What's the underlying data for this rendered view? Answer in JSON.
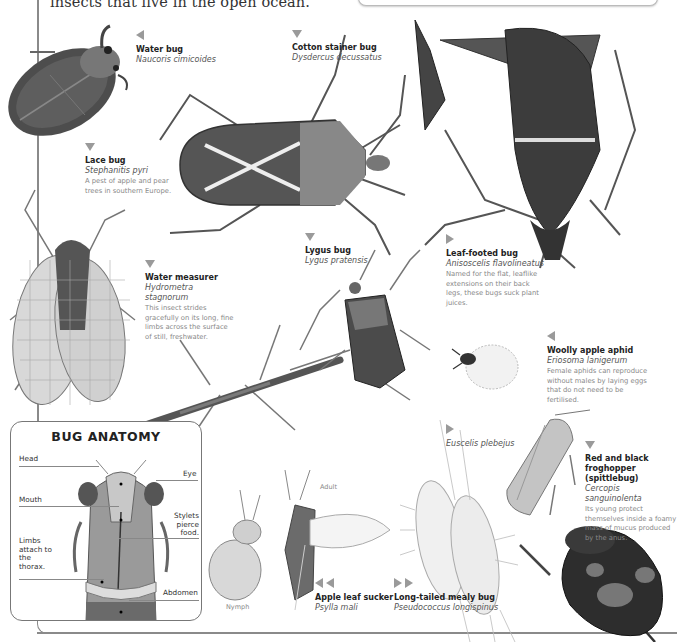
{
  "page": {
    "intro_text": "insects that live in the open ocean."
  },
  "species": [
    {
      "id": "water-bug",
      "common": "Water bug",
      "latin": "Naucoris cimicoides",
      "description": "",
      "pointer": "left"
    },
    {
      "id": "cotton-stainer",
      "common": "Cotton stainer bug",
      "latin": "Dysdercus decussatus",
      "description": "",
      "pointer": "down"
    },
    {
      "id": "lace-bug",
      "common": "Lace bug",
      "latin": "Stephanitis pyri",
      "description": "A pest of apple and pear trees in southern Europe.",
      "pointer": "down"
    },
    {
      "id": "water-measurer",
      "common": "Water measurer",
      "latin": "Hydrometra stagnorum",
      "description": "This insect strides gracefully on its long, fine limbs across the surface of still, freshwater.",
      "pointer": "down"
    },
    {
      "id": "lygus-bug",
      "common": "Lygus bug",
      "latin": "Lygus pratensis",
      "description": "",
      "pointer": "down"
    },
    {
      "id": "leaf-footed-bug",
      "common": "Leaf-footed bug",
      "latin": "Anisoscelis flavolineatus",
      "description": "Named for the flat, leaflike extensions on their back legs, these bugs suck plant juices.",
      "pointer": "right"
    },
    {
      "id": "woolly-apple-aphid",
      "common": "Woolly apple aphid",
      "latin": "Eriosoma lanigerum",
      "description": "Female aphids can reproduce without males by laying eggs that do not need to be fertilised.",
      "pointer": "left"
    },
    {
      "id": "euscelis",
      "common": "",
      "latin": "Euscelis plebejus",
      "description": "",
      "pointer": "right"
    },
    {
      "id": "froghopper",
      "common": "Red and black froghopper (spittlebug)",
      "latin": "Cercopis sanguinolenta",
      "description": "Its young protect themselves inside a foamy mass of mucus produced by the anus.",
      "pointer": "down"
    },
    {
      "id": "apple-leaf-sucker",
      "common": "Apple leaf sucker",
      "latin": "Psylla mali",
      "description": "",
      "pointer": "left-double"
    },
    {
      "id": "mealy-bug",
      "common": "Long-tailed mealy bug",
      "latin": "Pseudococcus longispinus",
      "description": "",
      "pointer": "right-double"
    }
  ],
  "psylla_stages": {
    "adult": "Adult",
    "nymph": "Nymph"
  },
  "anatomy": {
    "title": "BUG ANATOMY",
    "labels": {
      "head": "Head",
      "eye": "Eye",
      "mouth": "Mouth",
      "stylets": "Stylets pierce food.",
      "limbs": "Limbs attach to the thorax.",
      "abdomen": "Abdomen"
    }
  },
  "colors": {
    "rule": "#8a8a8a",
    "pointer": "#9a9a9a",
    "text_dark": "#222222",
    "text_latin": "#555555",
    "text_desc": "#888888"
  }
}
